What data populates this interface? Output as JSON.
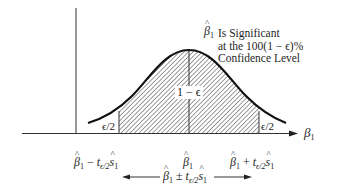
{
  "diagram": {
    "type": "normal-distribution-confidence-interval",
    "axis_label": "β1",
    "annotation": {
      "symbol": "β1",
      "lines": [
        "Is Significant",
        "at the 100(1 − ϵ)%",
        "Confidence Level"
      ]
    },
    "center_region_label": "1 − ϵ",
    "left_tail_label": "ϵ/2",
    "right_tail_label": "ϵ/2",
    "tick_labels": {
      "lower": {
        "base": "β1",
        "op": "−",
        "t": "t",
        "t_sub": "ϵ/2",
        "s": "s1"
      },
      "center": {
        "base": "β1"
      },
      "upper": {
        "base": "β1",
        "op": "+",
        "t": "t",
        "t_sub": "ϵ/2",
        "s": "s1"
      }
    },
    "interval_label": {
      "base": "β1",
      "op": "±",
      "t": "t",
      "t_sub": "ϵ/2",
      "s": "s1"
    },
    "colors": {
      "line": "#1a1a1a",
      "hatch": "#3a3a3a",
      "background": "#ffffff"
    }
  },
  "text": {
    "beta": "β",
    "sub1": "1",
    "s": "s",
    "t": "t",
    "teps": "ϵ/2",
    "minus": " − ",
    "plus": " + ",
    "pm": " ± ",
    "ann_line1": "Is Significant",
    "ann_line2": "at the 100(1 − ϵ)%",
    "ann_line3": "Confidence Level",
    "center": "1 − ϵ",
    "eps2": "ϵ/2"
  }
}
